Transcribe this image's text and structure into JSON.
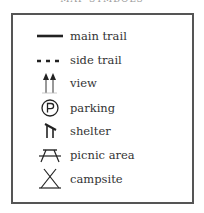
{
  "title": "MAP SYMBOLS",
  "legend": {
    "items": [
      {
        "icon": "main-trail-icon",
        "label": "main trail"
      },
      {
        "icon": "side-trail-icon",
        "label": "side trail"
      },
      {
        "icon": "view-icon",
        "label": "view"
      },
      {
        "icon": "parking-icon",
        "label": "parking"
      },
      {
        "icon": "shelter-icon",
        "label": "shelter"
      },
      {
        "icon": "picnic-area-icon",
        "label": "picnic area"
      },
      {
        "icon": "campsite-icon",
        "label": "campsite"
      }
    ]
  },
  "colors": {
    "border": "#555555",
    "ink": "#222222",
    "text": "#333333"
  }
}
